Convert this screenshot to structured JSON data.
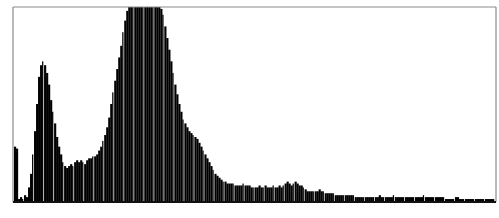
{
  "chart_data": {
    "type": "bar",
    "title": "",
    "xlabel": "",
    "ylabel": "",
    "grid": false,
    "legend": null,
    "bins": 240,
    "ylim": [
      0,
      100
    ],
    "clipped_at_top": true,
    "profile": [
      {
        "x": 0,
        "y": 28
      },
      {
        "x": 1,
        "y": 27
      },
      {
        "x": 2,
        "y": 1
      },
      {
        "x": 3,
        "y": 2
      },
      {
        "x": 4,
        "y": 1
      },
      {
        "x": 5,
        "y": 3
      },
      {
        "x": 6,
        "y": 2
      },
      {
        "x": 7,
        "y": 7
      },
      {
        "x": 8,
        "y": 14
      },
      {
        "x": 9,
        "y": 24
      },
      {
        "x": 10,
        "y": 36
      },
      {
        "x": 11,
        "y": 50
      },
      {
        "x": 12,
        "y": 64
      },
      {
        "x": 13,
        "y": 70
      },
      {
        "x": 14,
        "y": 72
      },
      {
        "x": 15,
        "y": 70
      },
      {
        "x": 16,
        "y": 66
      },
      {
        "x": 17,
        "y": 60
      },
      {
        "x": 18,
        "y": 52
      },
      {
        "x": 19,
        "y": 46
      },
      {
        "x": 20,
        "y": 40
      },
      {
        "x": 21,
        "y": 33
      },
      {
        "x": 22,
        "y": 28
      },
      {
        "x": 23,
        "y": 24
      },
      {
        "x": 24,
        "y": 20
      },
      {
        "x": 25,
        "y": 18
      },
      {
        "x": 26,
        "y": 17
      },
      {
        "x": 27,
        "y": 18
      },
      {
        "x": 28,
        "y": 19
      },
      {
        "x": 29,
        "y": 18
      },
      {
        "x": 30,
        "y": 20
      },
      {
        "x": 31,
        "y": 21
      },
      {
        "x": 32,
        "y": 20
      },
      {
        "x": 33,
        "y": 21
      },
      {
        "x": 34,
        "y": 20
      },
      {
        "x": 35,
        "y": 19
      },
      {
        "x": 36,
        "y": 21
      },
      {
        "x": 37,
        "y": 22
      },
      {
        "x": 38,
        "y": 22
      },
      {
        "x": 39,
        "y": 23
      },
      {
        "x": 40,
        "y": 23
      },
      {
        "x": 41,
        "y": 24
      },
      {
        "x": 42,
        "y": 26
      },
      {
        "x": 43,
        "y": 28
      },
      {
        "x": 44,
        "y": 31
      },
      {
        "x": 45,
        "y": 34
      },
      {
        "x": 46,
        "y": 38
      },
      {
        "x": 47,
        "y": 43
      },
      {
        "x": 48,
        "y": 50
      },
      {
        "x": 49,
        "y": 56
      },
      {
        "x": 50,
        "y": 62
      },
      {
        "x": 51,
        "y": 68
      },
      {
        "x": 52,
        "y": 74
      },
      {
        "x": 53,
        "y": 80
      },
      {
        "x": 54,
        "y": 87
      },
      {
        "x": 55,
        "y": 93
      },
      {
        "x": 56,
        "y": 98
      },
      {
        "x": 57,
        "y": 100
      },
      {
        "x": 58,
        "y": 100
      },
      {
        "x": 59,
        "y": 100
      },
      {
        "x": 60,
        "y": 100
      },
      {
        "x": 61,
        "y": 100
      },
      {
        "x": 62,
        "y": 100
      },
      {
        "x": 63,
        "y": 100
      },
      {
        "x": 64,
        "y": 100
      },
      {
        "x": 65,
        "y": 100
      },
      {
        "x": 66,
        "y": 100
      },
      {
        "x": 67,
        "y": 100
      },
      {
        "x": 68,
        "y": 100
      },
      {
        "x": 69,
        "y": 100
      },
      {
        "x": 70,
        "y": 100
      },
      {
        "x": 71,
        "y": 100
      },
      {
        "x": 72,
        "y": 100
      },
      {
        "x": 73,
        "y": 99
      },
      {
        "x": 74,
        "y": 96
      },
      {
        "x": 75,
        "y": 90
      },
      {
        "x": 76,
        "y": 84
      },
      {
        "x": 77,
        "y": 78
      },
      {
        "x": 78,
        "y": 72
      },
      {
        "x": 79,
        "y": 66
      },
      {
        "x": 80,
        "y": 60
      },
      {
        "x": 81,
        "y": 55
      },
      {
        "x": 82,
        "y": 50
      },
      {
        "x": 83,
        "y": 46
      },
      {
        "x": 84,
        "y": 42
      },
      {
        "x": 85,
        "y": 40
      },
      {
        "x": 86,
        "y": 38
      },
      {
        "x": 87,
        "y": 36
      },
      {
        "x": 88,
        "y": 35
      },
      {
        "x": 89,
        "y": 34
      },
      {
        "x": 90,
        "y": 33
      },
      {
        "x": 91,
        "y": 32
      },
      {
        "x": 92,
        "y": 30
      },
      {
        "x": 93,
        "y": 28
      },
      {
        "x": 94,
        "y": 26
      },
      {
        "x": 95,
        "y": 24
      },
      {
        "x": 96,
        "y": 22
      },
      {
        "x": 97,
        "y": 20
      },
      {
        "x": 98,
        "y": 18
      },
      {
        "x": 99,
        "y": 16
      },
      {
        "x": 100,
        "y": 14
      },
      {
        "x": 101,
        "y": 13
      },
      {
        "x": 102,
        "y": 12
      },
      {
        "x": 103,
        "y": 11
      },
      {
        "x": 104,
        "y": 10
      },
      {
        "x": 105,
        "y": 10
      },
      {
        "x": 106,
        "y": 9
      },
      {
        "x": 107,
        "y": 9
      },
      {
        "x": 108,
        "y": 9
      },
      {
        "x": 109,
        "y": 9
      },
      {
        "x": 110,
        "y": 8
      },
      {
        "x": 111,
        "y": 8
      },
      {
        "x": 112,
        "y": 8
      },
      {
        "x": 113,
        "y": 8
      },
      {
        "x": 114,
        "y": 9
      },
      {
        "x": 115,
        "y": 8
      },
      {
        "x": 116,
        "y": 8
      },
      {
        "x": 117,
        "y": 8
      },
      {
        "x": 118,
        "y": 7
      },
      {
        "x": 119,
        "y": 7
      },
      {
        "x": 120,
        "y": 7
      },
      {
        "x": 121,
        "y": 7
      },
      {
        "x": 122,
        "y": 8
      },
      {
        "x": 123,
        "y": 7
      },
      {
        "x": 124,
        "y": 7
      },
      {
        "x": 125,
        "y": 8
      },
      {
        "x": 126,
        "y": 7
      },
      {
        "x": 127,
        "y": 7
      },
      {
        "x": 128,
        "y": 7
      },
      {
        "x": 129,
        "y": 8
      },
      {
        "x": 130,
        "y": 7
      },
      {
        "x": 131,
        "y": 7
      },
      {
        "x": 132,
        "y": 8
      },
      {
        "x": 133,
        "y": 7
      },
      {
        "x": 134,
        "y": 8
      },
      {
        "x": 135,
        "y": 9
      },
      {
        "x": 136,
        "y": 10
      },
      {
        "x": 137,
        "y": 9
      },
      {
        "x": 138,
        "y": 8
      },
      {
        "x": 139,
        "y": 9
      },
      {
        "x": 140,
        "y": 10
      },
      {
        "x": 141,
        "y": 9
      },
      {
        "x": 142,
        "y": 8
      },
      {
        "x": 143,
        "y": 8
      },
      {
        "x": 144,
        "y": 7
      },
      {
        "x": 145,
        "y": 6
      },
      {
        "x": 146,
        "y": 5
      },
      {
        "x": 147,
        "y": 5
      },
      {
        "x": 148,
        "y": 5
      },
      {
        "x": 149,
        "y": 5
      },
      {
        "x": 150,
        "y": 5
      },
      {
        "x": 151,
        "y": 5
      },
      {
        "x": 152,
        "y": 6
      },
      {
        "x": 153,
        "y": 5
      },
      {
        "x": 154,
        "y": 5
      },
      {
        "x": 155,
        "y": 4
      },
      {
        "x": 156,
        "y": 4
      },
      {
        "x": 157,
        "y": 4
      },
      {
        "x": 158,
        "y": 4
      },
      {
        "x": 159,
        "y": 4
      },
      {
        "x": 160,
        "y": 3
      },
      {
        "x": 161,
        "y": 3
      },
      {
        "x": 162,
        "y": 3
      },
      {
        "x": 163,
        "y": 3
      },
      {
        "x": 164,
        "y": 3
      },
      {
        "x": 165,
        "y": 3
      },
      {
        "x": 166,
        "y": 3
      },
      {
        "x": 167,
        "y": 3
      },
      {
        "x": 168,
        "y": 3
      },
      {
        "x": 169,
        "y": 3
      },
      {
        "x": 170,
        "y": 2
      },
      {
        "x": 171,
        "y": 2
      },
      {
        "x": 172,
        "y": 2
      },
      {
        "x": 173,
        "y": 2
      },
      {
        "x": 174,
        "y": 2
      },
      {
        "x": 175,
        "y": 2
      },
      {
        "x": 176,
        "y": 2
      },
      {
        "x": 177,
        "y": 2
      },
      {
        "x": 178,
        "y": 2
      },
      {
        "x": 179,
        "y": 2
      },
      {
        "x": 180,
        "y": 2
      },
      {
        "x": 181,
        "y": 2
      },
      {
        "x": 182,
        "y": 3
      },
      {
        "x": 183,
        "y": 2
      },
      {
        "x": 184,
        "y": 2
      },
      {
        "x": 185,
        "y": 2
      },
      {
        "x": 186,
        "y": 2
      },
      {
        "x": 187,
        "y": 2
      },
      {
        "x": 188,
        "y": 2
      },
      {
        "x": 189,
        "y": 3
      },
      {
        "x": 190,
        "y": 2
      },
      {
        "x": 191,
        "y": 2
      },
      {
        "x": 192,
        "y": 2
      },
      {
        "x": 193,
        "y": 2
      },
      {
        "x": 194,
        "y": 2
      },
      {
        "x": 195,
        "y": 2
      },
      {
        "x": 196,
        "y": 2
      },
      {
        "x": 197,
        "y": 2
      },
      {
        "x": 198,
        "y": 2
      },
      {
        "x": 199,
        "y": 2
      },
      {
        "x": 200,
        "y": 2
      },
      {
        "x": 201,
        "y": 2
      },
      {
        "x": 202,
        "y": 2
      },
      {
        "x": 203,
        "y": 2
      },
      {
        "x": 204,
        "y": 3
      },
      {
        "x": 205,
        "y": 2
      },
      {
        "x": 206,
        "y": 2
      },
      {
        "x": 207,
        "y": 2
      },
      {
        "x": 208,
        "y": 2
      },
      {
        "x": 209,
        "y": 2
      },
      {
        "x": 210,
        "y": 2
      },
      {
        "x": 211,
        "y": 2
      },
      {
        "x": 212,
        "y": 2
      },
      {
        "x": 213,
        "y": 2
      },
      {
        "x": 214,
        "y": 2
      },
      {
        "x": 215,
        "y": 1
      },
      {
        "x": 216,
        "y": 1
      },
      {
        "x": 217,
        "y": 1
      },
      {
        "x": 218,
        "y": 1
      },
      {
        "x": 219,
        "y": 1
      },
      {
        "x": 220,
        "y": 2
      },
      {
        "x": 221,
        "y": 2
      },
      {
        "x": 222,
        "y": 1
      },
      {
        "x": 223,
        "y": 1
      },
      {
        "x": 224,
        "y": 1
      },
      {
        "x": 225,
        "y": 1
      },
      {
        "x": 226,
        "y": 1
      },
      {
        "x": 227,
        "y": 1
      },
      {
        "x": 228,
        "y": 1
      },
      {
        "x": 229,
        "y": 1
      },
      {
        "x": 230,
        "y": 1
      },
      {
        "x": 231,
        "y": 1
      },
      {
        "x": 232,
        "y": 1
      },
      {
        "x": 233,
        "y": 1
      },
      {
        "x": 234,
        "y": 1
      },
      {
        "x": 235,
        "y": 1
      },
      {
        "x": 236,
        "y": 1
      },
      {
        "x": 237,
        "y": 1
      },
      {
        "x": 238,
        "y": 1
      },
      {
        "x": 239,
        "y": 1
      }
    ],
    "gap_every_bins": 5,
    "colors": {
      "bar": "#000000",
      "background": "#ffffff",
      "frame": "#8a8a8a",
      "baseline": "#111111"
    }
  }
}
